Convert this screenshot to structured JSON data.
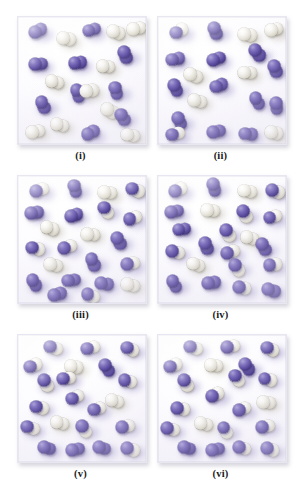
{
  "figure": {
    "panel_count": 6,
    "layout": {
      "rows": 3,
      "cols": 2
    },
    "legend": {
      "purple_atom": "purple sphere (element A)",
      "white_atom": "white sphere (element B)",
      "purple_molecule": "A2 diatomic molecule",
      "white_molecule": "B2 diatomic molecule",
      "mixed_molecule": "AB diatomic product molecule"
    },
    "colors": {
      "purple": "#5a4a9e",
      "purple_light": "#a9a0d6",
      "purple_dark": "#2b2057",
      "white": "#f7f6f2",
      "white_dark": "#c9c5b6",
      "box_background": "#fcfbfe",
      "box_border": "#e8e6f0",
      "caption": "#1a1a1a",
      "page_background": "#ffffff"
    }
  },
  "chart_data": {
    "type": "scatter",
    "xlabel": "",
    "ylabel": "",
    "xlim": [
      0,
      100
    ],
    "ylim": [
      0,
      100
    ],
    "grid": false,
    "legend": "none",
    "note": "Six square reaction vessels, each containing diatomic molecules drawn as pairs of touching spheres. Molecule composition shifts from separate A2 + B2 reactants toward AB product across panels i to vi.",
    "panels": [
      {
        "id": "i",
        "label": "(i)",
        "counts": {
          "purple_purple": 11,
          "white_white": 9,
          "purple_white": 0,
          "total": 20
        },
        "molecules": [
          {
            "type": "pp",
            "x": 16,
            "y": 11,
            "angle": -28
          },
          {
            "type": "ww",
            "x": 38,
            "y": 17,
            "angle": 12
          },
          {
            "type": "pp",
            "x": 58,
            "y": 10,
            "angle": -16
          },
          {
            "type": "ww",
            "x": 77,
            "y": 12,
            "angle": 20
          },
          {
            "type": "ww",
            "x": 93,
            "y": 9,
            "angle": -8
          },
          {
            "type": "pp",
            "x": 84,
            "y": 30,
            "angle": 68
          },
          {
            "type": "pp",
            "x": 16,
            "y": 37,
            "angle": -4
          },
          {
            "type": "pp",
            "x": 47,
            "y": 36,
            "angle": -10
          },
          {
            "type": "ww",
            "x": 69,
            "y": 39,
            "angle": 6
          },
          {
            "type": "ww",
            "x": 29,
            "y": 51,
            "angle": 18
          },
          {
            "type": "pp",
            "x": 77,
            "y": 58,
            "angle": 74
          },
          {
            "type": "pp",
            "x": 47,
            "y": 60,
            "angle": 72
          },
          {
            "type": "ww",
            "x": 56,
            "y": 58,
            "angle": -6
          },
          {
            "type": "pp",
            "x": 20,
            "y": 69,
            "angle": 64
          },
          {
            "type": "ww",
            "x": 72,
            "y": 74,
            "angle": 28
          },
          {
            "type": "pp",
            "x": 82,
            "y": 79,
            "angle": 58
          },
          {
            "type": "ww",
            "x": 14,
            "y": 90,
            "angle": -12
          },
          {
            "type": "ww",
            "x": 33,
            "y": 85,
            "angle": 16
          },
          {
            "type": "pp",
            "x": 57,
            "y": 91,
            "angle": -24
          },
          {
            "type": "ww",
            "x": 88,
            "y": 93,
            "angle": 8
          }
        ]
      },
      {
        "id": "ii",
        "label": "(ii)",
        "counts": {
          "purple_purple": 12,
          "white_white": 6,
          "purple_white": 2,
          "total": 20
        },
        "molecules": [
          {
            "type": "pw",
            "x": 17,
            "y": 11,
            "angle": -30
          },
          {
            "type": "pp",
            "x": 45,
            "y": 11,
            "angle": 66
          },
          {
            "type": "ww",
            "x": 70,
            "y": 14,
            "angle": 10
          },
          {
            "type": "ww",
            "x": 91,
            "y": 10,
            "angle": -14
          },
          {
            "type": "pp",
            "x": 14,
            "y": 33,
            "angle": -12
          },
          {
            "type": "pp",
            "x": 46,
            "y": 33,
            "angle": -18
          },
          {
            "type": "pp",
            "x": 78,
            "y": 28,
            "angle": 54
          },
          {
            "type": "ww",
            "x": 28,
            "y": 46,
            "angle": 22
          },
          {
            "type": "ww",
            "x": 70,
            "y": 44,
            "angle": 4
          },
          {
            "type": "pp",
            "x": 92,
            "y": 41,
            "angle": 70
          },
          {
            "type": "pp",
            "x": 14,
            "y": 56,
            "angle": 62
          },
          {
            "type": "pp",
            "x": 48,
            "y": 54,
            "angle": -20
          },
          {
            "type": "ww",
            "x": 31,
            "y": 66,
            "angle": 14
          },
          {
            "type": "pp",
            "x": 78,
            "y": 66,
            "angle": 58
          },
          {
            "type": "pp",
            "x": 93,
            "y": 70,
            "angle": 80
          },
          {
            "type": "pp",
            "x": 17,
            "y": 82,
            "angle": 64
          },
          {
            "type": "pw",
            "x": 14,
            "y": 92,
            "angle": -16
          },
          {
            "type": "pp",
            "x": 46,
            "y": 90,
            "angle": -14
          },
          {
            "type": "pp",
            "x": 71,
            "y": 92,
            "angle": 6
          },
          {
            "type": "ww",
            "x": 91,
            "y": 91,
            "angle": 12
          }
        ]
      },
      {
        "id": "iii",
        "label": "(iii)",
        "counts": {
          "purple_purple": 9,
          "white_white": 5,
          "purple_white": 8,
          "total": 22
        },
        "molecules": [
          {
            "type": "pw",
            "x": 17,
            "y": 11,
            "angle": -26
          },
          {
            "type": "pp",
            "x": 45,
            "y": 10,
            "angle": 72
          },
          {
            "type": "ww",
            "x": 70,
            "y": 13,
            "angle": 8
          },
          {
            "type": "pw",
            "x": 92,
            "y": 11,
            "angle": 24
          },
          {
            "type": "pp",
            "x": 13,
            "y": 29,
            "angle": -10
          },
          {
            "type": "pp",
            "x": 44,
            "y": 31,
            "angle": -16
          },
          {
            "type": "pw",
            "x": 69,
            "y": 27,
            "angle": 58
          },
          {
            "type": "pw",
            "x": 90,
            "y": 33,
            "angle": -18
          },
          {
            "type": "ww",
            "x": 25,
            "y": 41,
            "angle": 20
          },
          {
            "type": "ww",
            "x": 57,
            "y": 46,
            "angle": 6
          },
          {
            "type": "pp",
            "x": 79,
            "y": 51,
            "angle": 62
          },
          {
            "type": "pw",
            "x": 14,
            "y": 57,
            "angle": 14
          },
          {
            "type": "pw",
            "x": 39,
            "y": 56,
            "angle": -22
          },
          {
            "type": "ww",
            "x": 28,
            "y": 70,
            "angle": 18
          },
          {
            "type": "pp",
            "x": 59,
            "y": 68,
            "angle": 66
          },
          {
            "type": "pw",
            "x": 88,
            "y": 69,
            "angle": -12
          },
          {
            "type": "pp",
            "x": 13,
            "y": 84,
            "angle": 60
          },
          {
            "type": "pp",
            "x": 42,
            "y": 82,
            "angle": -8
          },
          {
            "type": "pp",
            "x": 68,
            "y": 85,
            "angle": 10
          },
          {
            "type": "ww",
            "x": 88,
            "y": 86,
            "angle": 16
          },
          {
            "type": "pp",
            "x": 31,
            "y": 93,
            "angle": -14
          },
          {
            "type": "pw",
            "x": 57,
            "y": 94,
            "angle": 22
          }
        ]
      },
      {
        "id": "iv",
        "label": "(iv)",
        "counts": {
          "purple_purple": 8,
          "white_white": 4,
          "purple_white": 10,
          "total": 22
        },
        "molecules": [
          {
            "type": "pw",
            "x": 16,
            "y": 11,
            "angle": -28
          },
          {
            "type": "pp",
            "x": 44,
            "y": 9,
            "angle": 74
          },
          {
            "type": "ww",
            "x": 70,
            "y": 12,
            "angle": 10
          },
          {
            "type": "pw",
            "x": 92,
            "y": 12,
            "angle": 20
          },
          {
            "type": "pp",
            "x": 13,
            "y": 28,
            "angle": -12
          },
          {
            "type": "ww",
            "x": 41,
            "y": 27,
            "angle": 6
          },
          {
            "type": "pw",
            "x": 68,
            "y": 30,
            "angle": 56
          },
          {
            "type": "pw",
            "x": 90,
            "y": 32,
            "angle": -16
          },
          {
            "type": "pp",
            "x": 19,
            "y": 42,
            "angle": -6
          },
          {
            "type": "pw",
            "x": 55,
            "y": 45,
            "angle": 60
          },
          {
            "type": "ww",
            "x": 72,
            "y": 49,
            "angle": 14
          },
          {
            "type": "pp",
            "x": 38,
            "y": 55,
            "angle": 68
          },
          {
            "type": "pw",
            "x": 14,
            "y": 60,
            "angle": 16
          },
          {
            "type": "pw",
            "x": 57,
            "y": 60,
            "angle": -20
          },
          {
            "type": "pp",
            "x": 83,
            "y": 56,
            "angle": 64
          },
          {
            "type": "ww",
            "x": 30,
            "y": 70,
            "angle": 22
          },
          {
            "type": "pw",
            "x": 62,
            "y": 72,
            "angle": 58
          },
          {
            "type": "pw",
            "x": 90,
            "y": 70,
            "angle": -10
          },
          {
            "type": "pp",
            "x": 13,
            "y": 85,
            "angle": 62
          },
          {
            "type": "pp",
            "x": 42,
            "y": 84,
            "angle": -8
          },
          {
            "type": "pw",
            "x": 66,
            "y": 88,
            "angle": 12
          },
          {
            "type": "pp",
            "x": 89,
            "y": 90,
            "angle": 18
          }
        ]
      },
      {
        "id": "v",
        "label": "(v)",
        "counts": {
          "purple_purple": 4,
          "white_white": 3,
          "purple_white": 14,
          "total": 21
        },
        "molecules": [
          {
            "type": "pw",
            "x": 28,
            "y": 10,
            "angle": 20
          },
          {
            "type": "pw",
            "x": 57,
            "y": 10,
            "angle": -16
          },
          {
            "type": "pw",
            "x": 88,
            "y": 11,
            "angle": 24
          },
          {
            "type": "pw",
            "x": 12,
            "y": 24,
            "angle": -20
          },
          {
            "type": "ww",
            "x": 44,
            "y": 25,
            "angle": 8
          },
          {
            "type": "pw",
            "x": 22,
            "y": 38,
            "angle": 62
          },
          {
            "type": "pw",
            "x": 86,
            "y": 36,
            "angle": 18
          },
          {
            "type": "pw",
            "x": 45,
            "y": 49,
            "angle": -24
          },
          {
            "type": "ww",
            "x": 76,
            "y": 52,
            "angle": 10
          },
          {
            "type": "pw",
            "x": 17,
            "y": 57,
            "angle": 14
          },
          {
            "type": "pw",
            "x": 62,
            "y": 58,
            "angle": -18
          },
          {
            "type": "ww",
            "x": 33,
            "y": 69,
            "angle": 16
          },
          {
            "type": "pw",
            "x": 10,
            "y": 73,
            "angle": 22
          },
          {
            "type": "pw",
            "x": 52,
            "y": 74,
            "angle": 60
          },
          {
            "type": "pw",
            "x": 84,
            "y": 72,
            "angle": -12
          },
          {
            "type": "pp",
            "x": 23,
            "y": 89,
            "angle": 10
          },
          {
            "type": "pp",
            "x": 45,
            "y": 90,
            "angle": -10
          },
          {
            "type": "pp",
            "x": 66,
            "y": 89,
            "angle": 14
          },
          {
            "type": "pw",
            "x": 88,
            "y": 90,
            "angle": 20
          },
          {
            "type": "pw",
            "x": 38,
            "y": 34,
            "angle": -6
          },
          {
            "type": "pp",
            "x": 70,
            "y": 26,
            "angle": 56
          }
        ]
      },
      {
        "id": "vi",
        "label": "(vi)",
        "counts": {
          "purple_purple": 3,
          "white_white": 3,
          "purple_white": 15,
          "total": 21
        },
        "molecules": [
          {
            "type": "pw",
            "x": 28,
            "y": 10,
            "angle": 18
          },
          {
            "type": "pw",
            "x": 57,
            "y": 9,
            "angle": -14
          },
          {
            "type": "pw",
            "x": 88,
            "y": 11,
            "angle": 26
          },
          {
            "type": "pw",
            "x": 12,
            "y": 24,
            "angle": -22
          },
          {
            "type": "ww",
            "x": 44,
            "y": 24,
            "angle": 10
          },
          {
            "type": "pw",
            "x": 22,
            "y": 38,
            "angle": 60
          },
          {
            "type": "pw",
            "x": 86,
            "y": 35,
            "angle": 16
          },
          {
            "type": "pw",
            "x": 45,
            "y": 47,
            "angle": -26
          },
          {
            "type": "pw",
            "x": 62,
            "y": 34,
            "angle": 54
          },
          {
            "type": "ww",
            "x": 85,
            "y": 53,
            "angle": 8
          },
          {
            "type": "pw",
            "x": 18,
            "y": 58,
            "angle": 12
          },
          {
            "type": "pw",
            "x": 66,
            "y": 58,
            "angle": -20
          },
          {
            "type": "ww",
            "x": 36,
            "y": 70,
            "angle": 18
          },
          {
            "type": "pw",
            "x": 10,
            "y": 74,
            "angle": 20
          },
          {
            "type": "pw",
            "x": 53,
            "y": 75,
            "angle": 58
          },
          {
            "type": "pw",
            "x": 84,
            "y": 72,
            "angle": -10
          },
          {
            "type": "pp",
            "x": 23,
            "y": 89,
            "angle": 12
          },
          {
            "type": "pp",
            "x": 45,
            "y": 90,
            "angle": -12
          },
          {
            "type": "pw",
            "x": 66,
            "y": 89,
            "angle": 16
          },
          {
            "type": "pw",
            "x": 88,
            "y": 90,
            "angle": 22
          },
          {
            "type": "pp",
            "x": 70,
            "y": 25,
            "angle": 56
          }
        ]
      }
    ]
  }
}
